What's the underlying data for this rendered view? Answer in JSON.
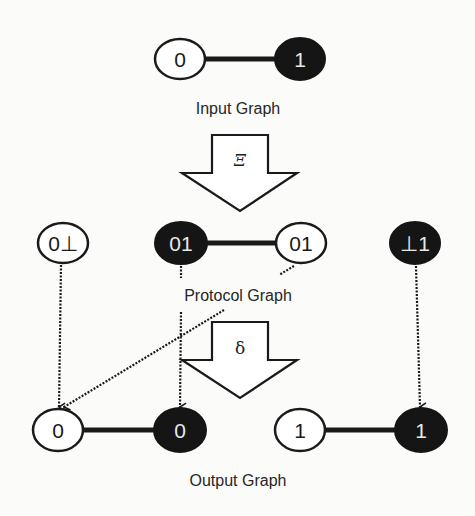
{
  "colors": {
    "background": "#fbfbfa",
    "stroke": "#1a1a1a",
    "filled_node": "#151515",
    "filled_text": "#e8e8e8",
    "open_node": "#ffffff",
    "open_text": "#1a1a1a",
    "label": "#262626"
  },
  "input_graph": {
    "label": "Input Graph",
    "nodes": [
      {
        "id": "in0",
        "text": "0",
        "filled": false,
        "cx": 180,
        "cy": 59
      },
      {
        "id": "in1",
        "text": "1",
        "filled": true,
        "cx": 300,
        "cy": 59
      }
    ],
    "edges": [
      [
        "in0",
        "in1"
      ]
    ]
  },
  "transform_xi": {
    "symbol": "Ξ"
  },
  "protocol_graph": {
    "label": "Protocol Graph",
    "nodes": [
      {
        "id": "p0",
        "text": "0⊥",
        "filled": false,
        "cx": 63,
        "cy": 243
      },
      {
        "id": "p1",
        "text": "01",
        "filled": true,
        "cx": 181,
        "cy": 243
      },
      {
        "id": "p2",
        "text": "01",
        "filled": false,
        "cx": 301,
        "cy": 243
      },
      {
        "id": "p3",
        "text": "⊥1",
        "filled": true,
        "cx": 415,
        "cy": 243
      }
    ],
    "edges": [
      [
        "p1",
        "p2"
      ]
    ]
  },
  "transform_delta": {
    "symbol": "δ"
  },
  "output_graph": {
    "label": "Output Graph",
    "nodes": [
      {
        "id": "o0",
        "text": "0",
        "filled": false,
        "cx": 58,
        "cy": 430
      },
      {
        "id": "o1",
        "text": "0",
        "filled": true,
        "cx": 180,
        "cy": 430
      },
      {
        "id": "o2",
        "text": "1",
        "filled": false,
        "cx": 300,
        "cy": 430
      },
      {
        "id": "o3",
        "text": "1",
        "filled": true,
        "cx": 421,
        "cy": 430
      }
    ],
    "edges": [
      [
        "o0",
        "o1"
      ],
      [
        "o2",
        "o3"
      ]
    ]
  },
  "mappings": [
    {
      "from": "p0",
      "to": "o0",
      "style": "dotted"
    },
    {
      "from": "p1",
      "to": "o1",
      "style": "dotted"
    },
    {
      "from": "p2",
      "to": "o0",
      "style": "dotted"
    },
    {
      "from": "p3",
      "to": "o3",
      "style": "dotted"
    }
  ]
}
